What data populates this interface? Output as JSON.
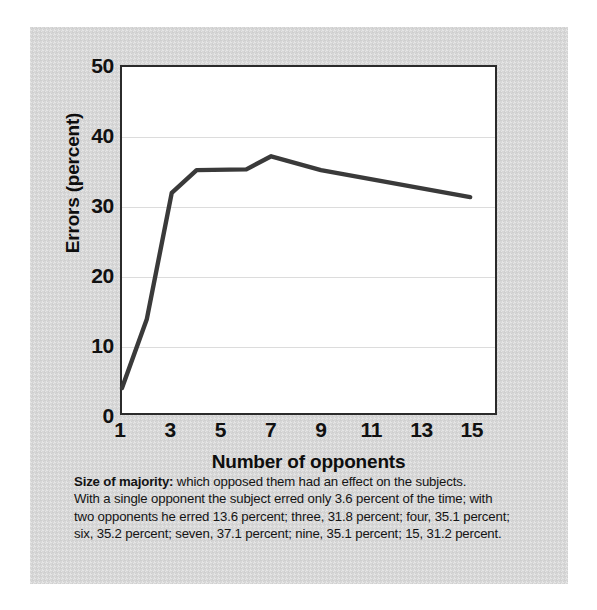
{
  "chart_data": {
    "type": "line",
    "title": "",
    "xlabel": "Number of opponents",
    "ylabel": "Errors (percent)",
    "x": [
      1,
      2,
      3,
      4,
      6,
      7,
      9,
      15
    ],
    "values": [
      3.6,
      13.6,
      31.8,
      35.1,
      35.2,
      37.1,
      35.1,
      31.2
    ],
    "series": [
      {
        "name": "Errors",
        "values": [
          3.6,
          13.6,
          31.8,
          35.1,
          35.2,
          37.1,
          35.1,
          31.2
        ]
      }
    ],
    "xlim": [
      1,
      16
    ],
    "ylim": [
      0,
      50
    ],
    "ytick_labels": [
      "0",
      "10",
      "20",
      "30",
      "40",
      "50"
    ],
    "ytick_values": [
      0,
      10,
      20,
      30,
      40,
      50
    ],
    "xtick_labels": [
      "1",
      "3",
      "5",
      "7",
      "9",
      "11",
      "13",
      "15"
    ],
    "xtick_values": [
      1,
      3,
      5,
      7,
      9,
      11,
      13,
      15
    ],
    "grid": "horizontal",
    "legend": "none",
    "line_color": "#3a3a3a",
    "plot_background": "#ffffff",
    "panel_background": "#d7d7d7"
  },
  "caption": {
    "lead": "Size of majority:",
    "line1_rest": " which opposed them had an effect on the subjects.",
    "line2": "With a single opponent the subject erred only 3.6 percent of the time; with",
    "line3": "two opponents he erred 13.6 percent; three, 31.8 percent; four, 35.1 percent;",
    "line4": "six, 35.2 percent; seven, 37.1 percent; nine, 35.1 percent; 15, 31.2 percent."
  }
}
